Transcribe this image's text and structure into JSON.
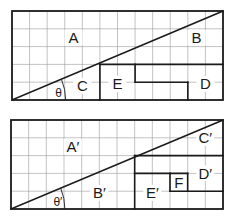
{
  "figures": [
    {
      "id": "top",
      "grid": {
        "columns": 12,
        "rows": 5
      },
      "diagonal": {
        "from": [
          0,
          0
        ],
        "to": [
          12,
          5
        ]
      },
      "angle_label": "θ",
      "labels": [
        {
          "text": "A",
          "at": [
            3.5,
            3.5
          ]
        },
        {
          "text": "B",
          "at": [
            10.5,
            3.5
          ]
        },
        {
          "text": "C",
          "at": [
            4.0,
            0.8
          ]
        },
        {
          "text": "E",
          "at": [
            6.0,
            0.9
          ]
        },
        {
          "text": "D",
          "at": [
            11.0,
            0.9
          ]
        }
      ],
      "partition_lines": [
        [
          [
            5,
            0
          ],
          [
            5,
            2
          ]
        ],
        [
          [
            5,
            2
          ],
          [
            12,
            2
          ]
        ],
        [
          [
            7,
            2
          ],
          [
            7,
            1
          ]
        ],
        [
          [
            7,
            1
          ],
          [
            10,
            1
          ]
        ],
        [
          [
            10,
            1
          ],
          [
            10,
            0
          ]
        ]
      ]
    },
    {
      "id": "bottom",
      "grid": {
        "columns": 12,
        "rows": 5
      },
      "diagonal": {
        "from": [
          0,
          0
        ],
        "to": [
          12,
          5
        ]
      },
      "angle_label": "θ′",
      "labels": [
        {
          "text": "A′",
          "at": [
            3.5,
            3.5
          ]
        },
        {
          "text": "B′",
          "at": [
            5.0,
            0.9
          ]
        },
        {
          "text": "C′",
          "at": [
            11.0,
            4.0
          ]
        },
        {
          "text": "D′",
          "at": [
            11.0,
            2.0
          ]
        },
        {
          "text": "E′",
          "at": [
            8.0,
            0.9
          ]
        },
        {
          "text": "F",
          "at": [
            9.5,
            1.5
          ]
        }
      ],
      "partition_lines": [
        [
          [
            7,
            0
          ],
          [
            7,
            3
          ]
        ],
        [
          [
            7,
            3
          ],
          [
            12,
            3
          ]
        ],
        [
          [
            7,
            2
          ],
          [
            10,
            2
          ]
        ],
        [
          [
            9,
            2
          ],
          [
            9,
            1
          ]
        ],
        [
          [
            9,
            1
          ],
          [
            12,
            1
          ]
        ],
        [
          [
            10,
            2
          ],
          [
            10,
            1
          ]
        ]
      ]
    }
  ]
}
